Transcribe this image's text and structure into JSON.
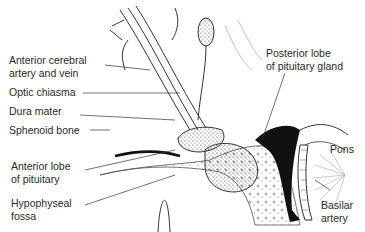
{
  "diagram": {
    "labels": {
      "anterior_cerebral_1": "Anterior cerebral",
      "anterior_cerebral_2": "artery and vein",
      "optic_chiasma": "Optic chiasma",
      "dura_mater": "Dura mater",
      "sphenoid_bone": "Sphenoid bone",
      "anterior_lobe_1": "Anterior lobe",
      "anterior_lobe_2": "of pituitary",
      "hypophyseal_1": "Hypophyseal",
      "hypophyseal_2": "fossa",
      "posterior_lobe_1": "Posterior lobe",
      "posterior_lobe_2": "of pituitary gland",
      "pons": "Pons",
      "basilar_1": "Basilar",
      "basilar_2": "artery"
    }
  }
}
